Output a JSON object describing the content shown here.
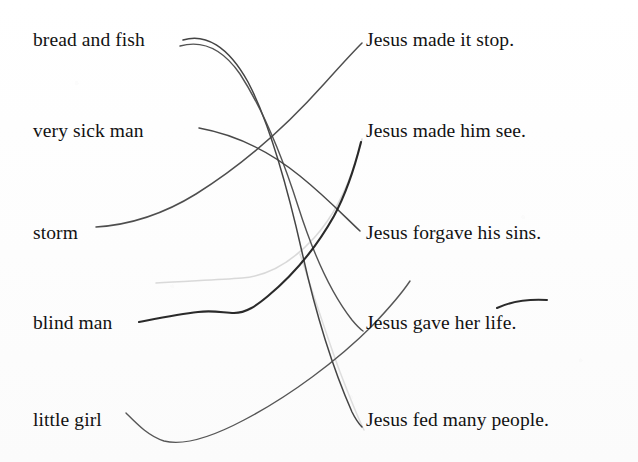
{
  "document": {
    "kind": "scanned-worksheet",
    "exercise_type": "matching",
    "background_color": "#fefefe",
    "ink_color": "#2b2b2b",
    "text_color": "#121212",
    "erased_line_color": "#cfcfcf"
  },
  "left_column": {
    "items": [
      {
        "id": "bread-and-fish",
        "label": "bread and fish",
        "x": 33,
        "y": 45
      },
      {
        "id": "very-sick-man",
        "label": "very sick man",
        "x": 33,
        "y": 136
      },
      {
        "id": "storm",
        "label": "storm",
        "x": 33,
        "y": 238
      },
      {
        "id": "blind-man",
        "label": "blind man",
        "x": 33,
        "y": 328
      },
      {
        "id": "little-girl",
        "label": "little girl",
        "x": 33,
        "y": 425
      }
    ]
  },
  "right_column": {
    "items": [
      {
        "id": "made-it-stop",
        "label": "Jesus made it stop.",
        "x": 366,
        "y": 45
      },
      {
        "id": "made-him-see",
        "label": "Jesus made him see.",
        "x": 366,
        "y": 136
      },
      {
        "id": "forgave-his-sins",
        "label": "Jesus forgave his sins.",
        "x": 366,
        "y": 238
      },
      {
        "id": "gave-her-life",
        "label": "Jesus gave her life.",
        "x": 366,
        "y": 328
      },
      {
        "id": "fed-many-people",
        "label": "Jesus fed many people.",
        "x": 366,
        "y": 425
      }
    ]
  },
  "connections": [
    {
      "id": "link-bread-to-fed",
      "from": "bread-and-fish",
      "to": "fed-many-people",
      "stroke": "#3a3a3a",
      "width": 1.5,
      "path": "M 183 40 C 205 33, 228 46, 248 82 C 270 124, 288 190, 302 252 C 314 306, 330 362, 352 412 C 356 420, 359 424, 362 427"
    },
    {
      "id": "link-bread-to-gave",
      "from": "bread-and-fish",
      "to": "gave-her-life",
      "stroke": "#4a4a4a",
      "width": 1.4,
      "path": "M 180 46 C 202 40, 222 48, 240 74 C 262 108, 282 156, 298 206 C 312 250, 330 292, 352 320 C 357 326, 360 329, 363 331"
    },
    {
      "id": "link-very-sick-to-forgave",
      "from": "very-sick-man",
      "to": "forgave-his-sins",
      "stroke": "#3f3f3f",
      "width": 1.5,
      "path": "M 199 128 C 232 134, 268 150, 300 176 C 326 197, 344 216, 360 231"
    },
    {
      "id": "link-storm-to-made-it-stop",
      "from": "storm",
      "to": "made-it-stop",
      "stroke": "#444444",
      "width": 1.5,
      "path": "M 96 227 C 128 225, 162 215, 196 194 C 246 163, 290 122, 324 84 C 342 64, 354 51, 362 43"
    },
    {
      "id": "link-blind-man-to-made-him-see",
      "from": "blind-man",
      "to": "made-him-see",
      "stroke": "#1f1f1f",
      "width": 2.1,
      "path": "M 139 322 C 160 318, 180 314, 198 312 C 214 310, 224 313, 234 313 C 246 313, 256 306, 268 296 C 292 276, 316 248, 334 216 C 348 190, 356 162, 361 142"
    },
    {
      "id": "link-little-girl-to-forgave",
      "from": "little-girl",
      "to": "forgave-his-sins",
      "stroke": "#4d4d4d",
      "width": 1.4,
      "path": "M 126 413 C 136 423, 148 436, 164 441 C 184 446, 212 437, 244 420 C 290 396, 338 360, 372 326 C 392 305, 404 290, 410 281"
    }
  ],
  "erased_marks": [
    {
      "id": "erased-line-blind-man",
      "note": "faint partially erased pencil stroke running beside the blind-man connector",
      "stroke": "#d2d2d2",
      "width": 1.6,
      "path": "M 156 283 C 186 281, 216 280, 242 278 C 268 276, 292 262, 314 238 C 334 216, 348 186, 356 160 C 359 150, 361 144, 362 139"
    },
    {
      "id": "erased-line-lower-right",
      "note": "faint erased stroke descending toward the lower right",
      "stroke": "#d8d8d8",
      "width": 1.5,
      "path": "M 300 254 C 312 290, 326 334, 340 372 C 350 398, 358 418, 364 430"
    }
  ],
  "annotations": [
    {
      "id": "overline-her",
      "note": "hand-drawn curved stroke above the word 'her'",
      "stroke": "#2b2b2b",
      "width": 2.0,
      "path": "M 497 308 C 512 301, 530 299, 547 300"
    }
  ]
}
